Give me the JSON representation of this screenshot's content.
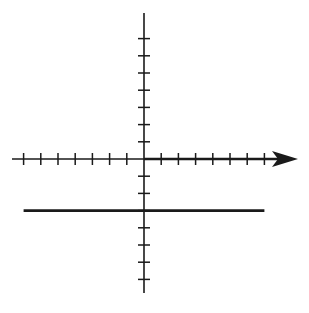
{
  "chart_data": {
    "type": "line",
    "title": "",
    "xlabel": "",
    "ylabel": "",
    "xlim": [
      -7,
      7
    ],
    "ylim": [
      -7,
      7
    ],
    "grid": false,
    "legend": null,
    "x_ticks": [
      -7,
      -6,
      -5,
      -4,
      -3,
      -2,
      -1,
      1,
      2,
      3,
      4,
      5,
      6,
      7
    ],
    "y_ticks": [
      -7,
      -6,
      -5,
      -4,
      -3,
      -2,
      -1,
      1,
      2,
      3,
      4,
      5,
      6,
      7
    ],
    "tick_labels_shown": false,
    "x_axis_arrow": "right",
    "series": [
      {
        "name": "y = -3",
        "x": [
          -7,
          7
        ],
        "y": [
          -3,
          -3
        ],
        "color": "#1a1a1a"
      }
    ]
  },
  "style": {
    "axis_color": "#1a1a1a",
    "line_color": "#1a1a1a",
    "background": "#ffffff"
  },
  "layout": {
    "origin_px": [
      144,
      159
    ],
    "unit_px": 17.2,
    "y_axis_top_px": 13,
    "y_axis_bottom_px": 293,
    "x_axis_left_px": 12,
    "arrow_tip_px": 298
  }
}
